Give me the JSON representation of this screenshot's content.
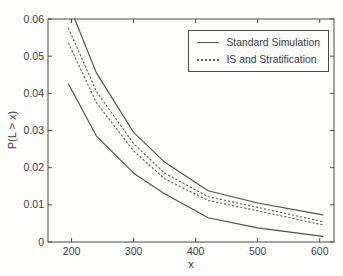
{
  "chart_data": {
    "type": "line",
    "title": "",
    "xlabel": "x",
    "ylabel": "P(L > x)",
    "xlim": [
      162,
      623
    ],
    "ylim": [
      0,
      0.06
    ],
    "grid": false,
    "xticks": {
      "values": [
        200,
        300,
        400,
        500,
        600
      ],
      "labels": [
        "200",
        "300",
        "400",
        "500",
        "600"
      ]
    },
    "yticks": {
      "values": [
        0,
        0.01,
        0.02,
        0.03,
        0.04,
        0.05,
        0.06
      ],
      "labels": [
        "0",
        "0.01",
        "0.02",
        "0.03",
        "0.04",
        "0.05",
        "0.06"
      ]
    },
    "legend": {
      "position": "top-right",
      "entries": [
        {
          "label": "Standard Simulation",
          "style": "solid"
        },
        {
          "label": "IS and Stratification",
          "style": "dotted"
        }
      ]
    },
    "series": [
      {
        "id": "standard-upper",
        "name": "Standard Simulation (upper band)",
        "style": "solid",
        "x": [
          205,
          240,
          300,
          350,
          420,
          500,
          605
        ],
        "y": [
          0.06,
          0.0455,
          0.0295,
          0.0215,
          0.0138,
          0.0105,
          0.0073
        ]
      },
      {
        "id": "is-upper",
        "name": "IS and Stratification (upper band)",
        "style": "dotted",
        "x": [
          195,
          240,
          300,
          350,
          420,
          500,
          605
        ],
        "y": [
          0.0575,
          0.0405,
          0.0265,
          0.0185,
          0.0122,
          0.0093,
          0.0055
        ]
      },
      {
        "id": "is-lower",
        "name": "IS and Stratification (lower band)",
        "style": "dotted",
        "x": [
          195,
          240,
          300,
          350,
          420,
          500,
          605
        ],
        "y": [
          0.0535,
          0.0375,
          0.0245,
          0.017,
          0.0112,
          0.0084,
          0.0046
        ]
      },
      {
        "id": "standard-lower",
        "name": "Standard Simulation (lower band)",
        "style": "solid",
        "x": [
          195,
          240,
          300,
          350,
          420,
          500,
          605
        ],
        "y": [
          0.0425,
          0.0285,
          0.0185,
          0.013,
          0.0065,
          0.0038,
          0.0015
        ]
      }
    ],
    "colors": {
      "line": "#4f4f4f",
      "dotted_line": "#5f5f5f",
      "axis": "#4a4a4a",
      "text": "#3c3c3c",
      "background": "#fdfdfc"
    }
  }
}
